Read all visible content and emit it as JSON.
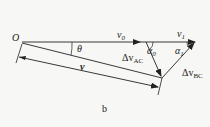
{
  "figure": {
    "caption": "b",
    "labels": {
      "origin": "O",
      "theta": "θ",
      "v0": "v",
      "v0_sub": "0",
      "v1": "v",
      "v1_sub": "1",
      "v": "v",
      "alpha0": "α",
      "alpha0_sub": "0",
      "alpha1": "α",
      "alpha1_sub": "1",
      "dv_ac": "Δv",
      "dv_ac_sub": "AC",
      "dv_bc": "Δv",
      "dv_bc_sub": "BC"
    },
    "colors": {
      "line": "#222222",
      "background": "#f7f7f5"
    }
  }
}
